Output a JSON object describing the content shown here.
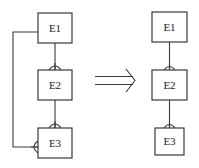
{
  "diagram": {
    "type": "entity-relationship transformation",
    "colors": {
      "stroke": "#3a3a3a",
      "text": "#222222",
      "background": "#ffffff"
    },
    "before": {
      "entities": [
        {
          "id": "E1",
          "label": "E1"
        },
        {
          "id": "E2",
          "label": "E2"
        },
        {
          "id": "E3",
          "label": "E3"
        }
      ],
      "relationships": [
        {
          "from": "E1",
          "to": "E2",
          "cardinality": "one-to-many"
        },
        {
          "from": "E2",
          "to": "E3",
          "cardinality": "one-to-many"
        },
        {
          "from": "E1",
          "to": "E3",
          "cardinality": "one-to-many",
          "route": "left-bracket"
        }
      ]
    },
    "arrow": {
      "style": "double-line implication arrow",
      "direction": "right"
    },
    "after": {
      "entities": [
        {
          "id": "E1",
          "label": "E1"
        },
        {
          "id": "E2",
          "label": "E2"
        },
        {
          "id": "E3",
          "label": "E3"
        }
      ],
      "relationships": [
        {
          "from": "E1",
          "to": "E2",
          "cardinality": "one-to-many"
        },
        {
          "from": "E2",
          "to": "E3",
          "cardinality": "one-to-many"
        }
      ]
    }
  }
}
